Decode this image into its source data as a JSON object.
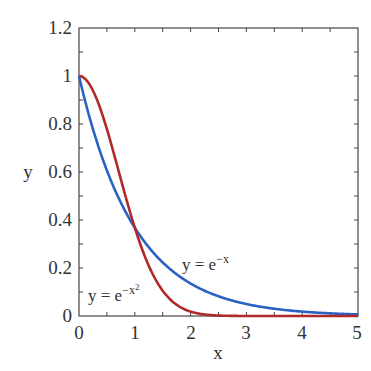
{
  "chart_data": {
    "type": "line",
    "title": "",
    "xlabel": "x",
    "ylabel": "y",
    "xlim": [
      0,
      5
    ],
    "ylim": [
      0,
      1.2
    ],
    "x_ticks": [
      "0",
      "1",
      "2",
      "3",
      "4",
      "5"
    ],
    "y_ticks": [
      "0",
      "0.2",
      "0.4",
      "0.6",
      "0.8",
      "1",
      "1.2"
    ],
    "grid": false,
    "legend": "none (inline annotations)",
    "series": [
      {
        "name": "y = e^-x",
        "color": "#2a62c4",
        "x": [
          0,
          0.5,
          1,
          1.5,
          2,
          2.5,
          3,
          3.5,
          4,
          4.5,
          5
        ],
        "values": [
          1.0,
          0.607,
          0.368,
          0.223,
          0.135,
          0.082,
          0.05,
          0.03,
          0.018,
          0.011,
          0.007
        ]
      },
      {
        "name": "y = e^-x^2",
        "color": "#b02a2a",
        "x": [
          0,
          0.25,
          0.5,
          0.75,
          1,
          1.25,
          1.5,
          1.75,
          2,
          2.5,
          3,
          4,
          5
        ],
        "values": [
          1.0,
          0.939,
          0.779,
          0.57,
          0.368,
          0.21,
          0.105,
          0.047,
          0.018,
          0.002,
          0.0001,
          0.0,
          0.0
        ]
      }
    ],
    "annotations": [
      {
        "text_main": "y = e",
        "text_sup": "−x",
        "near": [
          2.0,
          0.25
        ]
      },
      {
        "text_main": "y = e",
        "text_sup": "−x",
        "text_sup2": "2",
        "near": [
          0.15,
          0.1
        ]
      }
    ]
  },
  "labels": {
    "xlabel": "x",
    "ylabel": "y",
    "xticks": [
      "0",
      "1",
      "2",
      "3",
      "4",
      "5"
    ],
    "yticks": [
      "0",
      "0.2",
      "0.4",
      "0.6",
      "0.8",
      "1",
      "1.2"
    ],
    "annot_exp_main": "y = e",
    "annot_exp_sup": "−x",
    "annot_gauss_main": "y = e",
    "annot_gauss_sup": "−x",
    "annot_gauss_sup2": "2"
  }
}
